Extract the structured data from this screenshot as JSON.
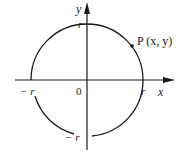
{
  "diagram": {
    "type": "coordinate-circle",
    "axes": {
      "x_label": "x",
      "y_label": "y",
      "origin_label": "0"
    },
    "circle": {
      "center": [
        0,
        0
      ],
      "radius_label": "r",
      "ticks": {
        "x_pos": "r",
        "x_neg": "− r",
        "y_pos": "r",
        "y_neg": "− r"
      }
    },
    "point": {
      "label": "P (x, y)",
      "name": "P",
      "coords": "(x, y)"
    },
    "colors": {
      "stroke": "#1a1a1a",
      "background": "#ffffff"
    }
  }
}
